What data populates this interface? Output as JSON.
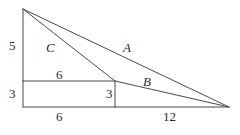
{
  "figure": {
    "kind": "geometry-diagram",
    "stroke_color": "#4a4a4a",
    "label_color": "#2a2a2a",
    "background_color": "#ffffff",
    "stroke_width": 1,
    "points": {
      "apex_top_left": {
        "x": 23,
        "y": 9
      },
      "left_mid": {
        "x": 23,
        "y": 81
      },
      "left_bottom": {
        "x": 23,
        "y": 107
      },
      "inner_corner_top": {
        "x": 115,
        "y": 81
      },
      "inner_corner_bottom": {
        "x": 115,
        "y": 107
      },
      "vertex_right": {
        "x": 229,
        "y": 107
      }
    },
    "segments": [
      {
        "name": "hypotenuse-a",
        "from": "apex_top_left",
        "to": "vertex_right"
      },
      {
        "name": "segment-c",
        "from": "apex_top_left",
        "to": "inner_corner_top"
      },
      {
        "name": "segment-b",
        "from": "inner_corner_top",
        "to": "vertex_right"
      },
      {
        "name": "left-vertical-upper",
        "from": "apex_top_left",
        "to": "left_mid"
      },
      {
        "name": "left-vertical-lower",
        "from": "left_mid",
        "to": "left_bottom"
      },
      {
        "name": "inner-horizontal-top",
        "from": "left_mid",
        "to": "inner_corner_top"
      },
      {
        "name": "inner-vertical",
        "from": "inner_corner_top",
        "to": "inner_corner_bottom"
      },
      {
        "name": "base-left",
        "from": "left_bottom",
        "to": "inner_corner_bottom"
      },
      {
        "name": "base-right",
        "from": "inner_corner_bottom",
        "to": "vertex_right"
      }
    ],
    "labels": {
      "side_a": "A",
      "side_b": "B",
      "side_c": "C",
      "left_upper": "5",
      "left_lower": "3",
      "inner_top": "6",
      "inner_right": "3",
      "base_left": "6",
      "base_right": "12"
    }
  }
}
